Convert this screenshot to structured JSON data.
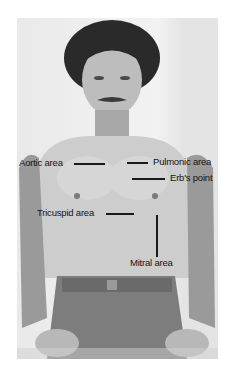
{
  "figure": {
    "labels": {
      "aortic": "Aortic area",
      "pulmonic": "Pulmonic area",
      "erbs": "Erb's point",
      "tricuspid": "Tricuspid area",
      "mitral": "Mitral area"
    },
    "colors": {
      "label_text": "#141414",
      "pointer_line": "#1a1a1a",
      "background": "#ffffff"
    }
  }
}
